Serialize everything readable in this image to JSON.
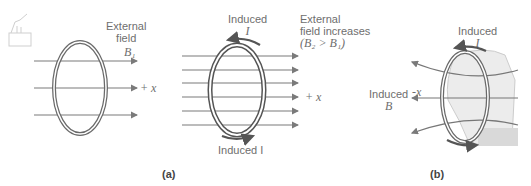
{
  "panel_a": {
    "caption": "(a)",
    "left": {
      "field_label_line1": "External",
      "field_label_line2": "field",
      "field_symbol": "B₁",
      "axis_label": "+ x"
    },
    "right": {
      "induced_top_line1": "Induced",
      "induced_top_line2": "I",
      "field_label_line1": "External",
      "field_label_line2": "field increases",
      "field_condition": "(B₂ > B₁)",
      "axis_label": "+ x",
      "induced_bottom": "Induced I"
    }
  },
  "panel_b": {
    "caption": "(b)",
    "induced_current_line1": "Induced",
    "induced_current_line2": "I",
    "induced_field_line1": "Induced",
    "induced_field_line2": "B",
    "axis_label": "-x"
  },
  "colors": {
    "line": "#7a7a7a",
    "loop": "#6a6a6a",
    "arrow_current": "#5a5a5a",
    "hand": "#e6e6e6"
  }
}
